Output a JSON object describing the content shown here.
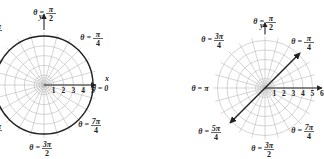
{
  "figures": [
    {
      "id": "left",
      "center": [
        44,
        85
      ],
      "unit_px": 9.8,
      "rings": [
        1,
        2,
        3,
        4,
        5
      ],
      "spokes_deg_step": 15,
      "highlight": {
        "type": "circle",
        "r": 5,
        "description": "r = 5 circle drawn bold"
      },
      "ray": {
        "theta": "0",
        "from": 0,
        "to": 5.3
      },
      "tick_labels": [
        "1",
        "2",
        "3",
        "4",
        "5"
      ],
      "axis_labels": {
        "x": "x",
        "y": "y"
      },
      "angle_labels": [
        {
          "text_lhs": "θ =",
          "num": "π",
          "den": "2",
          "pos": [
            48,
            13
          ]
        },
        {
          "text_lhs": "θ =",
          "num": "π",
          "den": "4",
          "pos": [
            95,
            38
          ]
        },
        {
          "text_lhs": "θ =",
          "num": "3π",
          "den": "4",
          "pos": [
            -6,
            30
          ]
        },
        {
          "text_lhs": "θ = 0",
          "num": "",
          "den": "",
          "pos": [
            100,
            91
          ]
        },
        {
          "text_lhs": "θ =",
          "num": "7π",
          "den": "4",
          "pos": [
            93,
            125
          ]
        },
        {
          "text_lhs": "θ =",
          "num": "5π",
          "den": "4",
          "pos": [
            -6,
            130
          ]
        },
        {
          "text_lhs": "θ =",
          "num": "3π",
          "den": "2",
          "pos": [
            44,
            148
          ]
        }
      ]
    },
    {
      "id": "right",
      "center": [
        265,
        88
      ],
      "unit_px": 9.5,
      "rings": [
        1,
        2,
        3,
        4,
        5
      ],
      "spokes_deg_step": 15,
      "highlight": {
        "type": "line",
        "theta_deg": 45,
        "description": "line θ = π/4 through origin, arrows both ends"
      },
      "ray": {
        "theta": "0",
        "from": 0,
        "to": 6
      },
      "tick_labels": [
        "1",
        "2",
        "3",
        "4",
        "5",
        "6"
      ],
      "axis_labels": {
        "y": "y"
      },
      "angle_labels": [
        {
          "text_lhs": "θ =",
          "num": "π",
          "den": "2",
          "pos": [
            268,
            22
          ]
        },
        {
          "text_lhs": "θ =",
          "num": "3π",
          "den": "4",
          "pos": [
            216,
            40
          ]
        },
        {
          "text_lhs": "θ =",
          "num": "π",
          "den": "4",
          "pos": [
            306,
            42
          ]
        },
        {
          "text_lhs": "θ = π",
          "num": "",
          "den": "",
          "pos": [
            200,
            91
          ]
        },
        {
          "text_lhs": "θ =",
          "num": "5π",
          "den": "4",
          "pos": [
            213,
            132
          ]
        },
        {
          "text_lhs": "θ =",
          "num": "7π",
          "den": "4",
          "pos": [
            306,
            131
          ]
        },
        {
          "text_lhs": "θ =",
          "num": "3π",
          "den": "2",
          "pos": [
            266,
            149
          ]
        }
      ]
    }
  ]
}
